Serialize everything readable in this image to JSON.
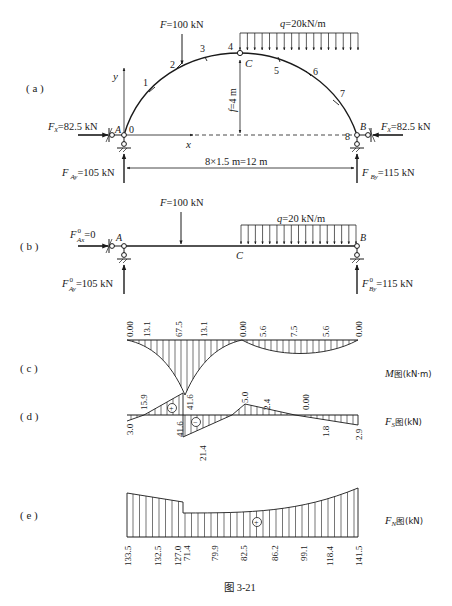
{
  "figure": {
    "caption": "图 3-21",
    "panels": {
      "a": {
        "label": "( a )",
        "load_F": "F=100 kN",
        "load_q": "q=20kN/m",
        "rise": "f=4 m",
        "span": "8×1.5 m=12 m",
        "hinge_C": "C",
        "support_A": "A",
        "support_B": "B",
        "axis_x": "x",
        "axis_y": "y",
        "Fx_left": "Fx=82.5 kN",
        "Fx_right": "Fx=82.5 kN",
        "FAy": "FAy=105 kN",
        "FBy": "FBy=115 kN",
        "section_points": [
          "0",
          "1",
          "2",
          "3",
          "4",
          "5",
          "6",
          "7",
          "8"
        ]
      },
      "b": {
        "label": "( b )",
        "load_F": "F=100 kN",
        "load_q": "q=20 kN/m",
        "FAx0": "F0Ax=0",
        "FAy0": "F0Ay=105 kN",
        "FBy0": "F0By=115 kN",
        "point_A": "A",
        "point_B": "B",
        "point_C": "C"
      },
      "c": {
        "label": "( c )",
        "title": "M图(kN·m)",
        "values": [
          "0.00",
          "13.1",
          "67.5",
          "13.1",
          "0.00",
          "5.6",
          "7.5",
          "5.6",
          "0.00"
        ]
      },
      "d": {
        "label": "( d )",
        "title": "FS图(kN)",
        "top_values": [
          "15.9",
          "41.6",
          "5.0",
          "2.4",
          "0.00"
        ],
        "bottom_values": [
          "3.0",
          "41.6",
          "21.4",
          "1.8",
          "2.9"
        ],
        "signs": [
          "+",
          "−"
        ]
      },
      "e": {
        "label": "( e )",
        "title": "FN图(kN)",
        "values": [
          "133.5",
          "132.5",
          "127.0",
          "71.4",
          "79.9",
          "82.5",
          "86.2",
          "99.1",
          "118.4",
          "141.5"
        ],
        "sign": "+"
      }
    }
  },
  "labels": {
    "a": "( a )",
    "b": "( b )",
    "c": "( c )",
    "d": "( d )",
    "e": "( e )",
    "M_title_main": "M",
    "M_title_rest": "图(kN·m)",
    "FS_title_F": "F",
    "FS_title_sub": "S",
    "FS_title_rest": "图(kN)",
    "FN_title_F": "F",
    "FN_title_sub": "N",
    "FN_title_rest": "图(kN)",
    "caption": "图 3-21",
    "F_a": "F",
    "F_a_rest": "=100 kN",
    "q_a": "q",
    "q_a_rest": "=20kN/m",
    "f_a": "f",
    "f_a_rest": "=4 m",
    "span": "8×1.5 m=12 m",
    "C": "C",
    "A": "A",
    "B": "B",
    "x": "x",
    "y": "y",
    "Fx": "F",
    "Fx_sub": "x",
    "Fx_val": "=82.5 kN",
    "FAy_F": "F",
    "FAy_sub": "Ay",
    "FAy_val": "=105 kN",
    "FBy_F": "F",
    "FBy_sub": "By",
    "FBy_val": "=115 kN",
    "F_b": "F",
    "F_b_rest": "=100 kN",
    "q_b": "q",
    "q_b_rest": "=20 kN/m",
    "FAx0_sub": "Ax",
    "sup0": "0",
    "FAx0_val": "=0",
    "FAy0_val": "=105 kN",
    "FBy0_val": "=115 kN",
    "pts": [
      "0",
      "1",
      "2",
      "3",
      "4",
      "5",
      "6",
      "7",
      "8"
    ],
    "M": [
      "0.00",
      "13.1",
      "67.5",
      "13.1",
      "0.00",
      "5.6",
      "7.5",
      "5.6",
      "0.00"
    ],
    "FS_top": [
      "15.9",
      "41.6",
      "5.0",
      "2.4",
      "0.00"
    ],
    "FS_bot": [
      "3.0",
      "41.6",
      "21.4",
      "1.8",
      "2.9"
    ],
    "FN": [
      "133.5",
      "132.5",
      "127.0",
      "71.4",
      "79.9",
      "82.5",
      "86.2",
      "99.1",
      "118.4",
      "141.5"
    ],
    "plus": "+",
    "minus": "−"
  }
}
